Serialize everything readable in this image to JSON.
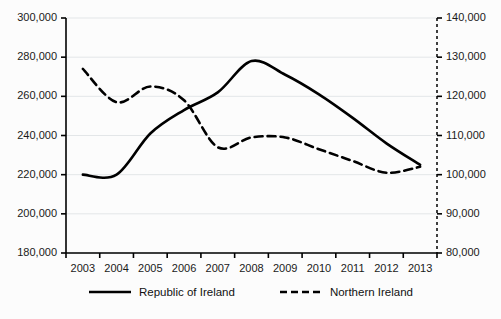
{
  "chart_data": {
    "type": "line",
    "title": "",
    "xlabel": "",
    "ylabel": "",
    "categories": [
      "2003",
      "2004",
      "2005",
      "2006",
      "2007",
      "2008",
      "2009",
      "2010",
      "2011",
      "2012",
      "2013"
    ],
    "grid": true,
    "legend_position": "bottom",
    "axes": {
      "left": {
        "ylabel": "",
        "ylim": [
          180000,
          300000
        ],
        "tick_step": 20000,
        "ticks": [
          "180,000",
          "200,000",
          "220,000",
          "240,000",
          "260,000",
          "280,000",
          "300,000"
        ],
        "tick_values": [
          180000,
          200000,
          220000,
          240000,
          260000,
          280000,
          300000
        ],
        "line_style": "solid"
      },
      "right": {
        "ylabel": "",
        "ylim": [
          80000,
          140000
        ],
        "tick_step": 10000,
        "ticks": [
          "80,000",
          "90,000",
          "100,000",
          "110,000",
          "120,000",
          "130,000",
          "140,000"
        ],
        "tick_values": [
          80000,
          90000,
          100000,
          110000,
          120000,
          130000,
          140000
        ],
        "line_style": "dashed"
      }
    },
    "series": [
      {
        "name": "Republic of Ireland",
        "axis": "left",
        "style": "solid",
        "color": "#000000",
        "values": [
          220000,
          220000,
          241000,
          253000,
          262000,
          278000,
          271000,
          261000,
          249000,
          236000,
          225000
        ]
      },
      {
        "name": "Northern Ireland",
        "axis": "right",
        "style": "dashed",
        "color": "#000000",
        "values": [
          127000,
          118500,
          122500,
          119000,
          107000,
          109500,
          109500,
          106500,
          103500,
          100500,
          102000
        ]
      }
    ]
  },
  "legend": {
    "items": [
      {
        "label": "Republic of Ireland",
        "style": "solid"
      },
      {
        "label": "Northern Ireland",
        "style": "dashed"
      }
    ]
  }
}
